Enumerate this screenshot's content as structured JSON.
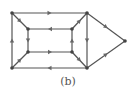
{
  "caption": "(b)",
  "colors": {
    "edge": "#555555",
    "node": "#444444",
    "arrow": "#666666"
  },
  "nodes": [
    {
      "id": "outer-tl",
      "x": 12,
      "y": 13
    },
    {
      "id": "outer-tr",
      "x": 87,
      "y": 13
    },
    {
      "id": "outer-bl",
      "x": 12,
      "y": 68
    },
    {
      "id": "outer-br",
      "x": 87,
      "y": 68
    },
    {
      "id": "inner-tl",
      "x": 28,
      "y": 29
    },
    {
      "id": "inner-tr",
      "x": 72,
      "y": 29
    },
    {
      "id": "inner-bl",
      "x": 28,
      "y": 52
    },
    {
      "id": "inner-br",
      "x": 72,
      "y": 52
    },
    {
      "id": "apex",
      "x": 125,
      "y": 41
    }
  ],
  "edges": [
    {
      "from": "outer-tl",
      "to": "outer-tr"
    },
    {
      "from": "outer-br",
      "to": "outer-bl"
    },
    {
      "from": "outer-bl",
      "to": "outer-tl"
    },
    {
      "from": "outer-tr",
      "to": "outer-br"
    },
    {
      "from": "inner-tr",
      "to": "inner-tl"
    },
    {
      "from": "inner-bl",
      "to": "inner-br"
    },
    {
      "from": "inner-tl",
      "to": "inner-bl"
    },
    {
      "from": "inner-br",
      "to": "inner-tr"
    },
    {
      "from": "outer-tl",
      "to": "inner-tl"
    },
    {
      "from": "outer-bl",
      "to": "inner-bl"
    },
    {
      "from": "inner-tr",
      "to": "outer-tr"
    },
    {
      "from": "inner-br",
      "to": "outer-br"
    },
    {
      "from": "outer-tr",
      "to": "apex"
    },
    {
      "from": "outer-br",
      "to": "apex"
    }
  ]
}
